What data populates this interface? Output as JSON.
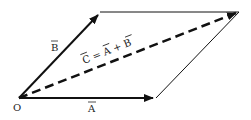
{
  "diagram": {
    "type": "vector-parallelogram",
    "colors": {
      "line": "#111111",
      "background": "#ffffff"
    },
    "points": {
      "origin": [
        19,
        98
      ],
      "a_tip": [
        156,
        98
      ],
      "b_tip": [
        100,
        12
      ],
      "c_tip": [
        239,
        12
      ]
    },
    "labels": {
      "origin": "O",
      "vector_a": "A",
      "vector_b": "B",
      "resultant": "C = A + B",
      "resultant_parts": {
        "c": "C",
        "eq": "=",
        "a": "A",
        "plus": "+",
        "b": "B"
      }
    }
  }
}
